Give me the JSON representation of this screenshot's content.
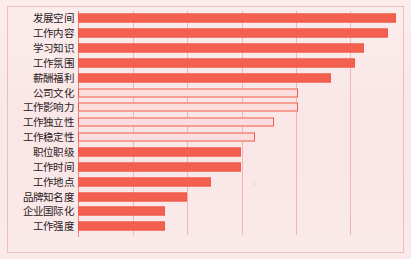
{
  "chart_data": {
    "type": "bar",
    "orientation": "horizontal",
    "title": "",
    "subtitle": "",
    "xlabel": "",
    "ylabel": "",
    "xlim": [
      0,
      120
    ],
    "ylim": null,
    "grid": true,
    "gridlines_x": [
      20,
      40,
      60,
      80,
      100
    ],
    "legend": null,
    "legend_position": "none",
    "tick_labels_x": [],
    "categories": [
      "发展空间",
      "工作内容",
      "学习知识",
      "工作氛围",
      "薪酬福利",
      "公司文化",
      "工作影响力",
      "工作独立性",
      "工作稳定性",
      "职位职级",
      "工作时间",
      "工作地点",
      "品牌知名度",
      "企业国际化",
      "工作强度"
    ],
    "values": [
      117,
      114,
      105,
      102,
      93,
      81,
      81,
      72,
      65,
      60,
      60,
      49,
      40,
      32,
      32
    ],
    "bar_styles": [
      "filled",
      "filled",
      "filled",
      "filled",
      "filled",
      "hollow",
      "hollow",
      "hollow",
      "hollow",
      "filled",
      "filled",
      "filled",
      "filled",
      "filled",
      "filled"
    ],
    "colors": {
      "bar_fill": "#f4604f",
      "bar_hollow_fill": "#fbdedd",
      "bar_border": "#ef5a4a",
      "gridline": "#f3a9a9",
      "axis": "#e8867f",
      "frame_border": "#f0bdbd",
      "background": "#fbeaea",
      "label_text": "#2a2024"
    }
  }
}
